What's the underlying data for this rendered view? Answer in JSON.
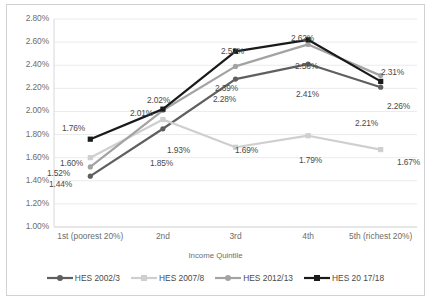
{
  "chart_data": {
    "type": "line",
    "title": "",
    "xlabel": "Income Quintile",
    "ylabel": "",
    "categories": [
      "1st (poorest 20%)",
      "2nd",
      "3rd",
      "4th",
      "5th (richest 20%)"
    ],
    "ylim": [
      1.0,
      2.8
    ],
    "ytick_labels": [
      "1.00%",
      "1.20%",
      "1.40%",
      "1.60%",
      "1.80%",
      "2.00%",
      "2.20%",
      "2.40%",
      "2.60%",
      "2.80%"
    ],
    "ytick_values": [
      1.0,
      1.2,
      1.4,
      1.6,
      1.8,
      2.0,
      2.2,
      2.4,
      2.6,
      2.8
    ],
    "grid": true,
    "legend_position": "bottom",
    "units": "percent",
    "series": [
      {
        "name": "HES 2002/3",
        "color": "#5f5f5f",
        "marker": "circle",
        "values": [
          1.44,
          1.85,
          2.28,
          2.41,
          2.21
        ],
        "labels": [
          "1.44%",
          "1.85%",
          "2.28%",
          "2.41%",
          "2.21%"
        ]
      },
      {
        "name": "HES 2007/8",
        "color": "#cfcfcf",
        "marker": "square",
        "values": [
          1.6,
          1.93,
          1.69,
          1.79,
          1.67
        ],
        "labels": [
          "1.60%",
          "1.93%",
          "1.69%",
          "1.79%",
          "1.67%"
        ]
      },
      {
        "name": "HES 2012/13",
        "color": "#a3a3a3",
        "marker": "circle",
        "values": [
          1.52,
          2.01,
          2.39,
          2.58,
          2.31
        ],
        "labels": [
          "1.52%",
          "2.01%",
          "2.39%",
          "2.58%",
          "2.31%"
        ]
      },
      {
        "name": "HES 20 17/18",
        "color": "#1a1a1a",
        "marker": "square",
        "values": [
          1.76,
          2.02,
          2.52,
          2.62,
          2.26
        ],
        "labels": [
          "1.76%",
          "2.02%",
          "2.52%",
          "2.62%",
          "2.26%"
        ]
      }
    ],
    "data_label_positions": [
      {
        "text": "1.76%",
        "x": 55,
        "y": 118
      },
      {
        "text": "1.60%",
        "x": 53,
        "y": 153
      },
      {
        "text": "1.52%",
        "x": 40,
        "y": 163
      },
      {
        "text": "1.44%",
        "x": 42,
        "y": 174
      },
      {
        "text": "2.02%",
        "x": 140,
        "y": 90
      },
      {
        "text": "2.01%",
        "x": 123,
        "y": 103
      },
      {
        "text": "1.93%",
        "x": 160,
        "y": 140
      },
      {
        "text": "1.85%",
        "x": 143,
        "y": 153
      },
      {
        "text": "2.52%",
        "x": 214,
        "y": 41
      },
      {
        "text": "2.39%",
        "x": 208,
        "y": 78
      },
      {
        "text": "2.28%",
        "x": 206,
        "y": 89
      },
      {
        "text": "1.69%",
        "x": 228,
        "y": 140
      },
      {
        "text": "2.62%",
        "x": 284,
        "y": 28
      },
      {
        "text": "2.58%",
        "x": 288,
        "y": 56
      },
      {
        "text": "2.41%",
        "x": 289,
        "y": 84
      },
      {
        "text": "1.79%",
        "x": 292,
        "y": 150
      },
      {
        "text": "2.31%",
        "x": 374,
        "y": 62
      },
      {
        "text": "2.26%",
        "x": 380,
        "y": 96
      },
      {
        "text": "2.21%",
        "x": 348,
        "y": 113
      },
      {
        "text": "1.67%",
        "x": 390,
        "y": 152
      }
    ]
  }
}
